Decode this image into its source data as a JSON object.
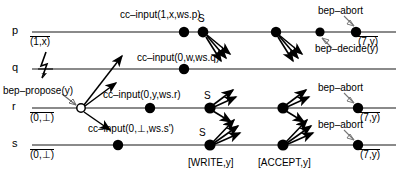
{
  "diagram": {
    "line_color": "#808080",
    "ink_color": "#000000",
    "processes": [
      {
        "id": "p",
        "name": "p",
        "initial_state": "(1,x)",
        "final_state": "(7,y)"
      },
      {
        "id": "q",
        "name": "q",
        "initial_state": "",
        "final_state": ""
      },
      {
        "id": "r",
        "name": "r",
        "initial_state": "(0,⊥)",
        "final_state": "(7,y)"
      },
      {
        "id": "s",
        "name": "s",
        "initial_state": "(0,⊥)",
        "final_state": "(7,y)"
      }
    ],
    "events": {
      "cc_input_p": "cc–input(1,x,ws.p)",
      "cc_input_q": "cc–input(0,w,ws.q)",
      "cc_input_r": "cc–input(0,y,ws.r)",
      "cc_input_s": "cc–input(0,⊥,ws.s')",
      "bep_propose": "bep–propose(y)",
      "bep_decide": "bep–decide(y)",
      "bep_abort_p": "bep–abort",
      "bep_abort_r": "bep–abort",
      "bep_abort_s": "bep–abort"
    },
    "send_markers": [
      {
        "id": "s-on-p",
        "label": "S"
      },
      {
        "id": "s-on-r",
        "label": "S"
      },
      {
        "id": "s-on-s",
        "label": "S"
      }
    ],
    "phase_labels": [
      {
        "id": "write-phase",
        "label": "[WRITE,y]"
      },
      {
        "id": "accept-phase",
        "label": "[ACCEPT,y]"
      }
    ],
    "crash_marker": {
      "id": "q-crash",
      "symbol": "crash-lightning"
    }
  }
}
